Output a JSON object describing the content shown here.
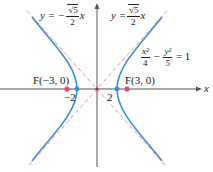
{
  "diagram": {
    "type": "hyperbola",
    "equation": {
      "lhs_term1_num": "x²",
      "lhs_term1_den": "4",
      "minus": "−",
      "lhs_term2_num": "y²",
      "lhs_term2_den": "5",
      "rhs": "= 1"
    },
    "asymptote_neg": {
      "prefix": "y = −",
      "num": "√5",
      "den": "2",
      "suffix": "x"
    },
    "asymptote_pos": {
      "prefix": "y =",
      "num": "√5",
      "den": "2",
      "suffix": "x"
    },
    "focus_left": "F(−3, 0)",
    "focus_right": "F(3, 0)",
    "vertex_left_label": "−2",
    "vertex_right_label": "2",
    "x_axis_label": "x",
    "colors": {
      "curve": "#3a8fd6",
      "asymptote": "#f08aa8",
      "focus": "#e8457a",
      "vertex": "#3a8fd6",
      "axis": "#555555"
    },
    "geometry": {
      "origin_px": [
        97,
        89
      ],
      "unit_px": 20.5,
      "a": 2,
      "b_squared": 5,
      "c": 3
    }
  }
}
